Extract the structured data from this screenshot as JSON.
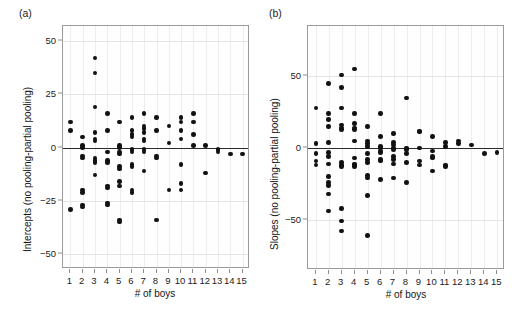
{
  "figure": {
    "panels": [
      {
        "label": "(a)",
        "ylabel": "Intercepts (no pooling-partial pooling)",
        "xlabel": "# of boys"
      },
      {
        "label": "(b)",
        "ylabel": "Slopes (no pooling-partial pooling)",
        "xlabel": "# of boys"
      }
    ]
  },
  "chart_data": [
    {
      "type": "scatter",
      "title": "(a)",
      "xlabel": "# of boys",
      "ylabel": "Intercepts (no pooling-partial pooling)",
      "xlim": [
        0.4,
        15.6
      ],
      "ylim": [
        -57,
        57
      ],
      "xticks": [
        1,
        2,
        3,
        4,
        5,
        6,
        7,
        8,
        9,
        10,
        11,
        12,
        13,
        14,
        15
      ],
      "yticks": [
        50,
        25,
        0,
        -25,
        -50
      ],
      "grid": true,
      "reference_line_y": 0,
      "points": [
        {
          "x": 1,
          "y": 12
        },
        {
          "x": 1,
          "y": 8
        },
        {
          "x": 1,
          "y": -29
        },
        {
          "x": 2,
          "y": 5
        },
        {
          "x": 2,
          "y": 1
        },
        {
          "x": 2,
          "y": 0
        },
        {
          "x": 2,
          "y": -4
        },
        {
          "x": 2,
          "y": -5
        },
        {
          "x": 2,
          "y": -20
        },
        {
          "x": 2,
          "y": -21
        },
        {
          "x": 2,
          "y": -27
        },
        {
          "x": 2,
          "y": -28
        },
        {
          "x": 3,
          "y": 42
        },
        {
          "x": 3,
          "y": 35
        },
        {
          "x": 3,
          "y": 19
        },
        {
          "x": 3,
          "y": 7
        },
        {
          "x": 3,
          "y": 4
        },
        {
          "x": 3,
          "y": 3
        },
        {
          "x": 3,
          "y": -5
        },
        {
          "x": 3,
          "y": -6
        },
        {
          "x": 3,
          "y": -7
        },
        {
          "x": 3,
          "y": -13
        },
        {
          "x": 4,
          "y": 16
        },
        {
          "x": 4,
          "y": 8
        },
        {
          "x": 4,
          "y": -2
        },
        {
          "x": 4,
          "y": -6
        },
        {
          "x": 4,
          "y": -7
        },
        {
          "x": 4,
          "y": -18
        },
        {
          "x": 4,
          "y": -19
        },
        {
          "x": 4,
          "y": -26
        },
        {
          "x": 4,
          "y": -27
        },
        {
          "x": 5,
          "y": 12
        },
        {
          "x": 5,
          "y": 1
        },
        {
          "x": 5,
          "y": 0
        },
        {
          "x": 5,
          "y": -2
        },
        {
          "x": 5,
          "y": -3
        },
        {
          "x": 5,
          "y": -9
        },
        {
          "x": 5,
          "y": -10
        },
        {
          "x": 5,
          "y": -16
        },
        {
          "x": 5,
          "y": -18
        },
        {
          "x": 5,
          "y": -34
        },
        {
          "x": 5,
          "y": -35
        },
        {
          "x": 6,
          "y": 14
        },
        {
          "x": 6,
          "y": 8
        },
        {
          "x": 6,
          "y": 6
        },
        {
          "x": 6,
          "y": 5
        },
        {
          "x": 6,
          "y": -1
        },
        {
          "x": 6,
          "y": -2
        },
        {
          "x": 6,
          "y": -8
        },
        {
          "x": 6,
          "y": -9
        },
        {
          "x": 6,
          "y": -20
        },
        {
          "x": 6,
          "y": -21
        },
        {
          "x": 7,
          "y": 16
        },
        {
          "x": 7,
          "y": 10
        },
        {
          "x": 7,
          "y": 9
        },
        {
          "x": 7,
          "y": 7
        },
        {
          "x": 7,
          "y": 4
        },
        {
          "x": 7,
          "y": 3
        },
        {
          "x": 7,
          "y": -1
        },
        {
          "x": 7,
          "y": -2
        },
        {
          "x": 7,
          "y": -11
        },
        {
          "x": 8,
          "y": 14
        },
        {
          "x": 8,
          "y": 8
        },
        {
          "x": 8,
          "y": -4
        },
        {
          "x": 8,
          "y": -5
        },
        {
          "x": 8,
          "y": -34
        },
        {
          "x": 9,
          "y": 10
        },
        {
          "x": 9,
          "y": 2
        },
        {
          "x": 9,
          "y": -20
        },
        {
          "x": 10,
          "y": 14
        },
        {
          "x": 10,
          "y": 12
        },
        {
          "x": 10,
          "y": 8
        },
        {
          "x": 10,
          "y": 4
        },
        {
          "x": 10,
          "y": -8
        },
        {
          "x": 10,
          "y": -17
        },
        {
          "x": 10,
          "y": -20
        },
        {
          "x": 11,
          "y": 16
        },
        {
          "x": 11,
          "y": 12
        },
        {
          "x": 11,
          "y": 6
        },
        {
          "x": 11,
          "y": 1
        },
        {
          "x": 12,
          "y": 1
        },
        {
          "x": 12,
          "y": -12
        },
        {
          "x": 13,
          "y": -2
        },
        {
          "x": 13,
          "y": -1
        },
        {
          "x": 14,
          "y": -3
        },
        {
          "x": 15,
          "y": -3
        }
      ]
    },
    {
      "type": "scatter",
      "title": "(b)",
      "xlabel": "# of boys",
      "ylabel": "Slopes (no pooling-partial pooling)",
      "xlim": [
        0.4,
        15.6
      ],
      "ylim": [
        -85,
        85
      ],
      "xticks": [
        1,
        2,
        3,
        4,
        5,
        6,
        7,
        8,
        9,
        10,
        11,
        12,
        13,
        14,
        15
      ],
      "yticks": [
        50,
        0,
        -50
      ],
      "grid": true,
      "reference_line_y": 0,
      "points": [
        {
          "x": 1,
          "y": 28
        },
        {
          "x": 1,
          "y": 3
        },
        {
          "x": 1,
          "y": -4
        },
        {
          "x": 1,
          "y": -9
        },
        {
          "x": 1,
          "y": -12
        },
        {
          "x": 2,
          "y": 45
        },
        {
          "x": 2,
          "y": 24
        },
        {
          "x": 2,
          "y": 20
        },
        {
          "x": 2,
          "y": 15
        },
        {
          "x": 2,
          "y": 4
        },
        {
          "x": 2,
          "y": -3
        },
        {
          "x": 2,
          "y": -6
        },
        {
          "x": 2,
          "y": -11
        },
        {
          "x": 2,
          "y": -20
        },
        {
          "x": 2,
          "y": -24
        },
        {
          "x": 2,
          "y": -26
        },
        {
          "x": 2,
          "y": -32
        },
        {
          "x": 2,
          "y": -44
        },
        {
          "x": 3,
          "y": 51
        },
        {
          "x": 3,
          "y": 42
        },
        {
          "x": 3,
          "y": 28
        },
        {
          "x": 3,
          "y": 16
        },
        {
          "x": 3,
          "y": 14
        },
        {
          "x": 3,
          "y": 13
        },
        {
          "x": 3,
          "y": -10
        },
        {
          "x": 3,
          "y": -12
        },
        {
          "x": 3,
          "y": -13
        },
        {
          "x": 3,
          "y": -42
        },
        {
          "x": 3,
          "y": -51
        },
        {
          "x": 3,
          "y": -58
        },
        {
          "x": 4,
          "y": 55
        },
        {
          "x": 4,
          "y": 24
        },
        {
          "x": 4,
          "y": 17
        },
        {
          "x": 4,
          "y": 14
        },
        {
          "x": 4,
          "y": 13
        },
        {
          "x": 4,
          "y": 5
        },
        {
          "x": 4,
          "y": -7
        },
        {
          "x": 4,
          "y": -11
        },
        {
          "x": 4,
          "y": -12
        },
        {
          "x": 4,
          "y": -13
        },
        {
          "x": 5,
          "y": 15
        },
        {
          "x": 5,
          "y": 5
        },
        {
          "x": 5,
          "y": 3
        },
        {
          "x": 5,
          "y": 1
        },
        {
          "x": 5,
          "y": -4
        },
        {
          "x": 5,
          "y": -8
        },
        {
          "x": 5,
          "y": -10
        },
        {
          "x": 5,
          "y": -19
        },
        {
          "x": 5,
          "y": -21
        },
        {
          "x": 5,
          "y": -33
        },
        {
          "x": 5,
          "y": -61
        },
        {
          "x": 6,
          "y": 24
        },
        {
          "x": 6,
          "y": 8
        },
        {
          "x": 6,
          "y": 1
        },
        {
          "x": 6,
          "y": 0
        },
        {
          "x": 6,
          "y": -2
        },
        {
          "x": 6,
          "y": -3
        },
        {
          "x": 6,
          "y": -8
        },
        {
          "x": 6,
          "y": -9
        },
        {
          "x": 6,
          "y": -22
        },
        {
          "x": 7,
          "y": 10
        },
        {
          "x": 7,
          "y": 4
        },
        {
          "x": 7,
          "y": 2
        },
        {
          "x": 7,
          "y": 0
        },
        {
          "x": 7,
          "y": -1
        },
        {
          "x": 7,
          "y": -6
        },
        {
          "x": 7,
          "y": -8
        },
        {
          "x": 7,
          "y": -11
        },
        {
          "x": 7,
          "y": -21
        },
        {
          "x": 8,
          "y": 35
        },
        {
          "x": 8,
          "y": 0
        },
        {
          "x": 8,
          "y": -1
        },
        {
          "x": 8,
          "y": -4
        },
        {
          "x": 8,
          "y": -10
        },
        {
          "x": 8,
          "y": -24
        },
        {
          "x": 9,
          "y": 12
        },
        {
          "x": 9,
          "y": 11
        },
        {
          "x": 9,
          "y": 0
        },
        {
          "x": 9,
          "y": -9
        },
        {
          "x": 9,
          "y": -12
        },
        {
          "x": 10,
          "y": 8
        },
        {
          "x": 10,
          "y": -2
        },
        {
          "x": 10,
          "y": -6
        },
        {
          "x": 10,
          "y": -7
        },
        {
          "x": 10,
          "y": -16
        },
        {
          "x": 11,
          "y": 4
        },
        {
          "x": 11,
          "y": 1
        },
        {
          "x": 11,
          "y": -12
        },
        {
          "x": 11,
          "y": -13
        },
        {
          "x": 12,
          "y": 5
        },
        {
          "x": 12,
          "y": 3
        },
        {
          "x": 13,
          "y": 2
        },
        {
          "x": 14,
          "y": -4
        },
        {
          "x": 15,
          "y": -3
        }
      ]
    }
  ]
}
